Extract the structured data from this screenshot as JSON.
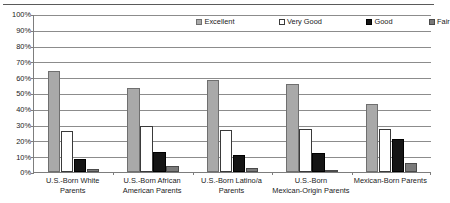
{
  "chart_data": {
    "type": "bar",
    "title": "",
    "subtitle": "",
    "xlabel": "",
    "ylabel": "",
    "ylim": [
      0,
      100
    ],
    "yticks": [
      "0%",
      "10%",
      "20%",
      "30%",
      "40%",
      "50%",
      "60%",
      "70%",
      "80%",
      "90%",
      "100%"
    ],
    "ytick_values": [
      0,
      10,
      20,
      30,
      40,
      50,
      60,
      70,
      80,
      90,
      100
    ],
    "grid": "horizontal",
    "legend_position": "top-center",
    "categories": [
      "U.S.-Born White Parents",
      "U.S.-Born African American Parents",
      "U.S.-Born Latino/a Parents",
      "U.S.-Born Mexican-Origin Parents",
      "Mexican-Born Parents"
    ],
    "category_lines": [
      [
        "U.S.-Born White Parents"
      ],
      [
        "U.S.-Born African",
        "American Parents"
      ],
      [
        "U.S.-Born Latino/a",
        "Parents"
      ],
      [
        "U.S.-Born",
        "Mexican-Origin Parents"
      ],
      [
        "Mexican-Born Parents"
      ]
    ],
    "series": [
      {
        "name": "Excellent",
        "color": "#a9a9a9",
        "values": [
          64,
          53,
          58.5,
          56,
          43
        ]
      },
      {
        "name": "Very Good",
        "color": "#ffffff",
        "values": [
          26,
          29,
          26.5,
          27.5,
          27
        ]
      },
      {
        "name": "Good",
        "color": "#151515",
        "values": [
          8,
          12.5,
          11,
          12,
          21
        ]
      },
      {
        "name": "Fair",
        "color": "#7a7a7a",
        "values": [
          2,
          3.5,
          2.5,
          1.2,
          6
        ]
      }
    ]
  },
  "legend": {
    "items": [
      {
        "label": "Excellent"
      },
      {
        "label": "Very Good"
      },
      {
        "label": "Good"
      },
      {
        "label": "Fair"
      }
    ]
  }
}
